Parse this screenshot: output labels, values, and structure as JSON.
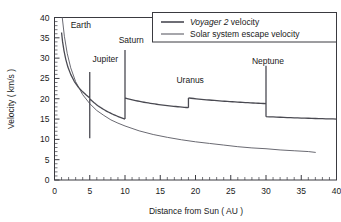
{
  "chart_data": {
    "type": "line",
    "title": "",
    "xlabel": "Distance from Sun ( AU )",
    "ylabel": "Velocity ( km/s )",
    "xlim": [
      0,
      40
    ],
    "ylim": [
      0,
      40
    ],
    "xticks": [
      0,
      5,
      10,
      15,
      20,
      25,
      30,
      35,
      40
    ],
    "yticks": [
      0,
      5,
      10,
      15,
      20,
      25,
      30,
      35,
      40
    ],
    "xtick_labels": [
      "0",
      "5",
      "10",
      "15",
      "20",
      "25",
      "30",
      "35",
      "40"
    ],
    "ytick_labels": [
      "0",
      "5",
      "10",
      "15",
      "20",
      "25",
      "30",
      "35",
      "40"
    ],
    "xminor_step": 1,
    "yminor_step": 1,
    "grid": false,
    "legend_position": "top-right",
    "legend": [
      {
        "name_italic": "Voyager 2",
        "name_rest": " velocity",
        "full": "Voyager 2 velocity"
      },
      {
        "name_italic": "",
        "name_rest": "Solar system escape velocity",
        "full": "Solar system escape velocity"
      }
    ],
    "annotations": [
      {
        "text": "Earth",
        "x": 2.3,
        "y": 37.5
      },
      {
        "text": "Jupiter",
        "x": 5.4,
        "y": 29.0
      },
      {
        "text": "Saturn",
        "x": 9.1,
        "y": 33.8
      },
      {
        "text": "Uranus",
        "x": 17.3,
        "y": 24.0
      },
      {
        "text": "Neptune",
        "x": 28.0,
        "y": 28.5
      }
    ],
    "series": [
      {
        "name": "Voyager 2 velocity",
        "style": "solid",
        "color": "#4a4a52",
        "width": 1.3,
        "points": [
          [
            1.0,
            36.3
          ],
          [
            1.15,
            34.0
          ],
          [
            1.35,
            31.8
          ],
          [
            1.6,
            29.7
          ],
          [
            1.9,
            27.8
          ],
          [
            2.3,
            26.0
          ],
          [
            2.8,
            24.3
          ],
          [
            3.4,
            22.8
          ],
          [
            4.0,
            21.7
          ],
          [
            4.5,
            20.9
          ],
          [
            5.0,
            20.2
          ]
        ],
        "gravity_assists": [
          {
            "body": "Jupiter",
            "x": 5.0,
            "pre_top": 26.6,
            "drop_to": 10.3,
            "post_from": 20.0
          },
          {
            "body": "Saturn",
            "x": 10.0,
            "pre_top": 32.0,
            "drop_to": 15.0,
            "post_from": 20.2
          },
          {
            "body": "Uranus",
            "x": 19.0,
            "pre_top": 22.2,
            "drop_to": 17.8,
            "post_from": 20.2
          },
          {
            "body": "Neptune",
            "x": 30.0,
            "pre_top": 28.1,
            "drop_to": 15.6,
            "post_from": 15.6
          }
        ],
        "segments": [
          {
            "from_x": 1.0,
            "to_x": 5.0,
            "from_y": 36.3,
            "to_y": 10.3,
            "note": "pre-Jupiter decaying arc"
          },
          {
            "from_x": 5.0,
            "to_x": 10.0,
            "from_y": 20.0,
            "to_y": 15.0,
            "note": "Jupiter to Saturn decay"
          },
          {
            "from_x": 10.0,
            "to_x": 19.0,
            "from_y": 20.2,
            "to_y": 17.8,
            "note": "Saturn to Uranus decay"
          },
          {
            "from_x": 19.0,
            "to_x": 30.0,
            "from_y": 20.2,
            "to_y": 18.8,
            "note": "Uranus to Neptune decay"
          },
          {
            "from_x": 30.0,
            "to_x": 40.0,
            "from_y": 15.6,
            "to_y": 15.0,
            "note": "post-Neptune cruise"
          }
        ]
      },
      {
        "name": "Solar system escape velocity",
        "style": "solid",
        "color": "#6a6a72",
        "width": 1.0,
        "points": [
          [
            1.0,
            42.0
          ],
          [
            1.1,
            40.0
          ],
          [
            1.4,
            35.4
          ],
          [
            1.8,
            31.2
          ],
          [
            2.3,
            27.6
          ],
          [
            3.0,
            24.2
          ],
          [
            4.0,
            21.0
          ],
          [
            5.0,
            18.8
          ],
          [
            6.0,
            17.1
          ],
          [
            7.0,
            15.9
          ],
          [
            8.0,
            14.8
          ],
          [
            9.0,
            14.0
          ],
          [
            10.0,
            13.3
          ],
          [
            12.0,
            12.1
          ],
          [
            14.0,
            11.2
          ],
          [
            16.0,
            10.5
          ],
          [
            18.0,
            9.9
          ],
          [
            20.0,
            9.4
          ],
          [
            22.0,
            9.0
          ],
          [
            24.0,
            8.6
          ],
          [
            26.0,
            8.2
          ],
          [
            28.0,
            7.9
          ],
          [
            30.0,
            7.7
          ],
          [
            32.0,
            7.4
          ],
          [
            34.0,
            7.2
          ],
          [
            36.0,
            7.0
          ],
          [
            37.0,
            6.8
          ]
        ]
      }
    ]
  },
  "axes": {
    "y_title": "Velocity ( km/s )",
    "x_title": "Distance from Sun ( AU )"
  }
}
